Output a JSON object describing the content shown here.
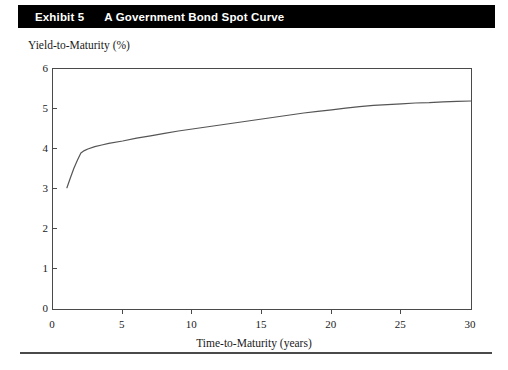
{
  "header": {
    "exhibit_number": "Exhibit 5",
    "title": "A Government Bond Spot Curve",
    "background_color": "#000000",
    "text_color": "#ffffff"
  },
  "chart_data": {
    "type": "line",
    "title": "A Government Bond Spot Curve",
    "xlabel": "Time-to-Maturity (years)",
    "ylabel": "Yield-to-Maturity (%)",
    "xlim": [
      0,
      30
    ],
    "ylim": [
      0,
      6
    ],
    "xticks": [
      "0",
      "5",
      "10",
      "15",
      "20",
      "25",
      "30"
    ],
    "xtick_values": [
      0,
      5,
      10,
      15,
      20,
      25,
      30
    ],
    "yticks": [
      "0",
      "1",
      "2",
      "3",
      "4",
      "5",
      "6"
    ],
    "ytick_values": [
      0,
      1,
      2,
      3,
      4,
      5,
      6
    ],
    "grid": false,
    "legend": null,
    "line_color": "#555555",
    "series": [
      {
        "name": "Government bond spot curve",
        "x": [
          1.0,
          1.25,
          1.5,
          1.75,
          2.0,
          2.25,
          2.5,
          3.0,
          3.5,
          4.0,
          5.0,
          6.0,
          7.0,
          8.0,
          9.0,
          10.0,
          11.0,
          12.0,
          13.0,
          14.0,
          15.0,
          16.0,
          17.0,
          18.0,
          19.0,
          20.0,
          21.0,
          22.0,
          23.0,
          24.0,
          25.0,
          26.0,
          27.0,
          28.0,
          29.0,
          30.0
        ],
        "values": [
          3.03,
          3.28,
          3.52,
          3.72,
          3.9,
          3.96,
          4.0,
          4.06,
          4.1,
          4.14,
          4.2,
          4.27,
          4.33,
          4.39,
          4.45,
          4.5,
          4.55,
          4.6,
          4.65,
          4.7,
          4.75,
          4.8,
          4.85,
          4.9,
          4.94,
          4.98,
          5.02,
          5.06,
          5.09,
          5.11,
          5.13,
          5.15,
          5.16,
          5.18,
          5.19,
          5.2
        ]
      }
    ]
  }
}
